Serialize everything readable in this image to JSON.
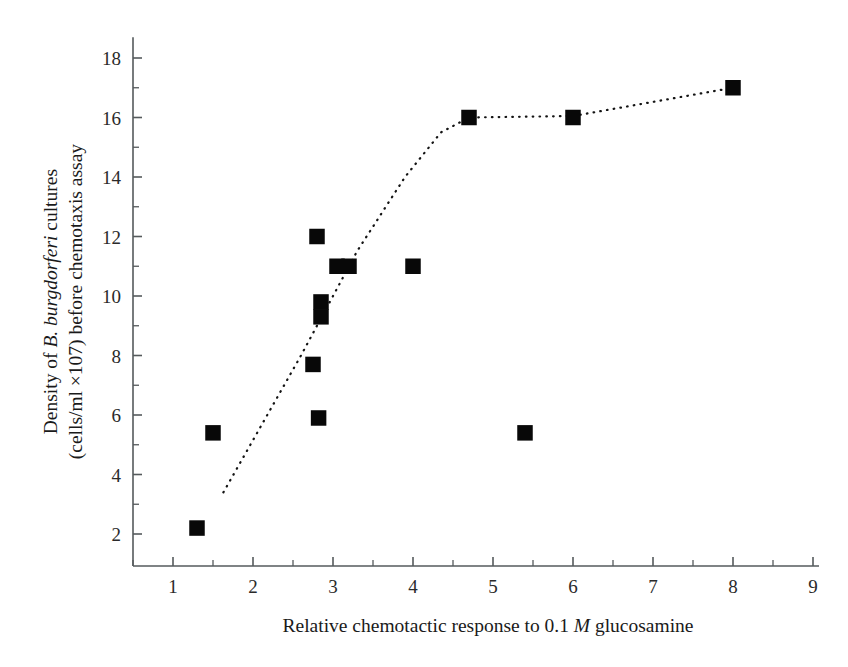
{
  "figure": {
    "background_color": "#ffffff",
    "marker_color": "#080808",
    "axis_color": "#555a5c",
    "trendline_color": "#141414"
  },
  "axes": {
    "x": {
      "title_parts": {
        "before": "Relative chemotactic response to 0.1 ",
        "italic": "M",
        "after": " glucosamine"
      },
      "title_full": "Relative chemotactic response to 0.1 M glucosamine",
      "ticks": [
        "1",
        "2",
        "3",
        "4",
        "5",
        "6",
        "7",
        "8",
        "9"
      ],
      "tick_values": [
        1,
        2,
        3,
        4,
        5,
        6,
        7,
        8,
        9
      ],
      "range": [
        0.5,
        9.0
      ],
      "minor_ticks_between": 1
    },
    "y": {
      "title_line1_parts": {
        "before": "Density of ",
        "italic": "B. burgdorferi",
        "after": " cultures"
      },
      "title_line1_full": "Density of B. burgdorferi cultures",
      "title_line2": "(cells/ml ×107) before chemotaxis assay",
      "ticks": [
        "2",
        "4",
        "6",
        "8",
        "10",
        "12",
        "14",
        "16",
        "18"
      ],
      "tick_values": [
        2,
        4,
        6,
        8,
        10,
        12,
        14,
        16,
        18
      ],
      "range": [
        1.0,
        18.7
      ],
      "minor_ticks_between": 1
    }
  },
  "chart_data": {
    "type": "scatter",
    "title": "",
    "xlabel": "Relative chemotactic response to 0.1 M glucosamine",
    "ylabel": "Density of B. burgdorferi cultures (cells/ml ×107) before chemotaxis assay",
    "xlim": [
      0.5,
      9.0
    ],
    "ylim": [
      1.0,
      18.7
    ],
    "xticks": [
      1,
      2,
      3,
      4,
      5,
      6,
      7,
      8,
      9
    ],
    "yticks": [
      2,
      4,
      6,
      8,
      10,
      12,
      14,
      16,
      18
    ],
    "grid": false,
    "legend": null,
    "marker_style": "filled-square",
    "points": [
      {
        "x": 1.3,
        "y": 2.2
      },
      {
        "x": 1.5,
        "y": 5.4
      },
      {
        "x": 2.75,
        "y": 7.7
      },
      {
        "x": 2.82,
        "y": 5.9
      },
      {
        "x": 2.8,
        "y": 12.0
      },
      {
        "x": 2.85,
        "y": 9.8
      },
      {
        "x": 2.85,
        "y": 9.3
      },
      {
        "x": 3.05,
        "y": 11.0
      },
      {
        "x": 3.2,
        "y": 11.0
      },
      {
        "x": 4.0,
        "y": 11.0
      },
      {
        "x": 4.7,
        "y": 16.0
      },
      {
        "x": 5.4,
        "y": 5.4
      },
      {
        "x": 6.0,
        "y": 16.0
      },
      {
        "x": 8.0,
        "y": 17.0
      }
    ],
    "series": [
      {
        "name": "trendline",
        "style": "dotted",
        "points": [
          {
            "x": 1.63,
            "y": 3.4
          },
          {
            "x": 2.6,
            "y": 8.0
          },
          {
            "x": 3.3,
            "y": 11.5
          },
          {
            "x": 3.9,
            "y": 14.0
          },
          {
            "x": 4.35,
            "y": 15.5
          },
          {
            "x": 4.7,
            "y": 16.0
          },
          {
            "x": 6.0,
            "y": 16.05
          },
          {
            "x": 8.0,
            "y": 17.0
          }
        ]
      }
    ]
  },
  "caption": {
    "text": "partially visible text line at bottom edge"
  }
}
